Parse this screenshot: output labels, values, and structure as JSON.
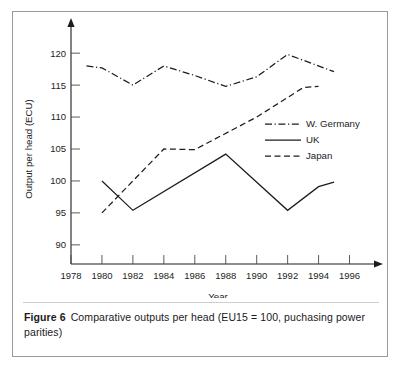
{
  "figure": {
    "label": "Figure 6",
    "caption": "Comparative outputs per head (EU15 = 100, puchasing power parities)"
  },
  "chart_data": {
    "type": "line",
    "title": "",
    "xlabel": "Year",
    "ylabel": "Output  per head (ECU)",
    "xlim": [
      1978,
      1997
    ],
    "ylim": [
      87,
      123
    ],
    "xticks": [
      1978,
      1980,
      1982,
      1984,
      1986,
      1988,
      1990,
      1992,
      1994,
      1996
    ],
    "yticks": [
      90,
      95,
      100,
      105,
      110,
      115,
      120
    ],
    "grid": false,
    "legend_position": "upper-right-inside",
    "series": [
      {
        "name": "W. Germany",
        "style": "dash-dot",
        "x": [
          1979,
          1980,
          1982,
          1984,
          1986,
          1988,
          1990,
          1992,
          1995
        ],
        "values": [
          118.0,
          117.7,
          115.0,
          118.0,
          116.5,
          114.8,
          116.3,
          119.8,
          117.1
        ]
      },
      {
        "name": "UK",
        "style": "solid",
        "x": [
          1980,
          1982,
          1988,
          1992,
          1994,
          1995
        ],
        "values": [
          100.0,
          95.4,
          104.2,
          95.4,
          99.1,
          99.8
        ]
      },
      {
        "name": "Japan",
        "style": "dashed",
        "x": [
          1980,
          1984,
          1986,
          1990,
          1993,
          1994
        ],
        "values": [
          95.0,
          105.0,
          104.9,
          110.0,
          114.6,
          114.8
        ]
      }
    ]
  },
  "legend": {
    "items": [
      {
        "label": "W. Germany",
        "style": "dash-dot"
      },
      {
        "label": "UK",
        "style": "solid"
      },
      {
        "label": "Japan",
        "style": "dashed"
      }
    ]
  }
}
